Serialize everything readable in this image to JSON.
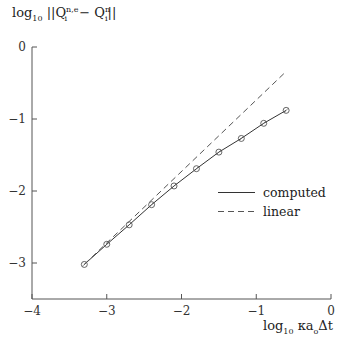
{
  "chart_data": {
    "type": "line",
    "title": "",
    "ylabel": "log10 ||Q_i^{n,e} - Q_i^n||",
    "xlabel": "log10 κ a_o Δt",
    "xlim": [
      -4,
      0
    ],
    "ylim": [
      -3.5,
      0
    ],
    "xticks": [
      -4,
      -3,
      -2,
      -1,
      0
    ],
    "xtick_labels": [
      "−4",
      "−3",
      "−2",
      "−1",
      "0"
    ],
    "yticks": [
      0,
      -1,
      -2,
      -3
    ],
    "ytick_labels": [
      "0",
      "−1",
      "−2",
      "−3"
    ],
    "grid": false,
    "legend_position": "center-right",
    "series": [
      {
        "name": "computed",
        "style": "solid",
        "marker": "circle",
        "x": [
          -3.3,
          -3.0,
          -2.7,
          -2.4,
          -2.1,
          -1.8,
          -1.5,
          -1.2,
          -0.9,
          -0.6
        ],
        "y": [
          -3.02,
          -2.74,
          -2.47,
          -2.19,
          -1.93,
          -1.69,
          -1.46,
          -1.27,
          -1.06,
          -0.88
        ]
      },
      {
        "name": "linear",
        "style": "dashed",
        "marker": "none",
        "x": [
          -3.3,
          -0.6
        ],
        "y": [
          -3.02,
          -0.34
        ]
      }
    ]
  },
  "labels": {
    "ylabel_main": "log",
    "ylabel_sub": "10",
    "ylabel_expr": " ||Q",
    "ylabel_q1_sup": "n,e",
    "ylabel_q1_sub": "i",
    "ylabel_minus": " − Q",
    "ylabel_q2_sup": "n",
    "ylabel_q2_sub": "i",
    "ylabel_close": "||",
    "xlabel_main": "log",
    "xlabel_sub": "10",
    "xlabel_expr": " κa",
    "xlabel_o": "o",
    "xlabel_tail": "Δt"
  },
  "legend": {
    "computed": "computed",
    "linear": "linear"
  },
  "colors": {
    "axis": "#555555",
    "line": "#333333",
    "dashed": "#555555",
    "marker": "#555555"
  }
}
